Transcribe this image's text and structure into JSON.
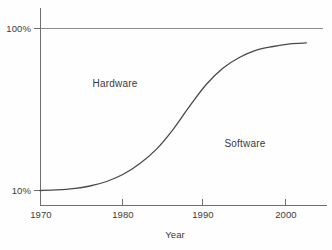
{
  "chart_data": {
    "type": "line",
    "title": "",
    "subtitle": "",
    "xlabel": "Year",
    "ylabel": "",
    "xlim": [
      1970,
      2004
    ],
    "ylim": [
      10,
      100
    ],
    "x_ticks": [
      1970,
      1980,
      1990,
      2000
    ],
    "x_tick_labels": [
      "1970",
      "1980",
      "1990",
      "2000"
    ],
    "y_ticks": [
      10,
      100
    ],
    "y_tick_labels": [
      "10%",
      "100%"
    ],
    "grid": "horizontal-top-only",
    "legend": "none",
    "annotations": [
      {
        "text": "Hardware",
        "x": 1980,
        "y": 62
      },
      {
        "text": "Software",
        "x": 1995,
        "y": 34
      }
    ],
    "series": [
      {
        "name": "Software share of system cost",
        "x": [
          1970,
          1972,
          1974,
          1976,
          1978,
          1980,
          1982,
          1984,
          1986,
          1988,
          1990,
          1992,
          1994,
          1996,
          1998,
          2000,
          2002
        ],
        "values": [
          10,
          10.3,
          11,
          12.5,
          15,
          19,
          25,
          33,
          44,
          57,
          69,
          78,
          84,
          88,
          90,
          91.5,
          92
        ]
      }
    ],
    "curve_description": "Smooth S-shaped (logistic) curve rising from 10% at 1970 to about 92% by 2002, inflection near 1988",
    "colors": {
      "curve": "#4a4a4a",
      "axis": "#6a6a6a",
      "gridline": "#8a8a8a",
      "text": "#3a3a3a",
      "background": "#fefefe"
    }
  },
  "axes": {
    "y_top_label": "100%",
    "y_bottom_label": "10%",
    "x_labels": [
      "1970",
      "1980",
      "1990",
      "2000"
    ],
    "x_axis_title": "Year"
  },
  "regions": {
    "upper_label": "Hardware",
    "lower_label": "Software"
  }
}
